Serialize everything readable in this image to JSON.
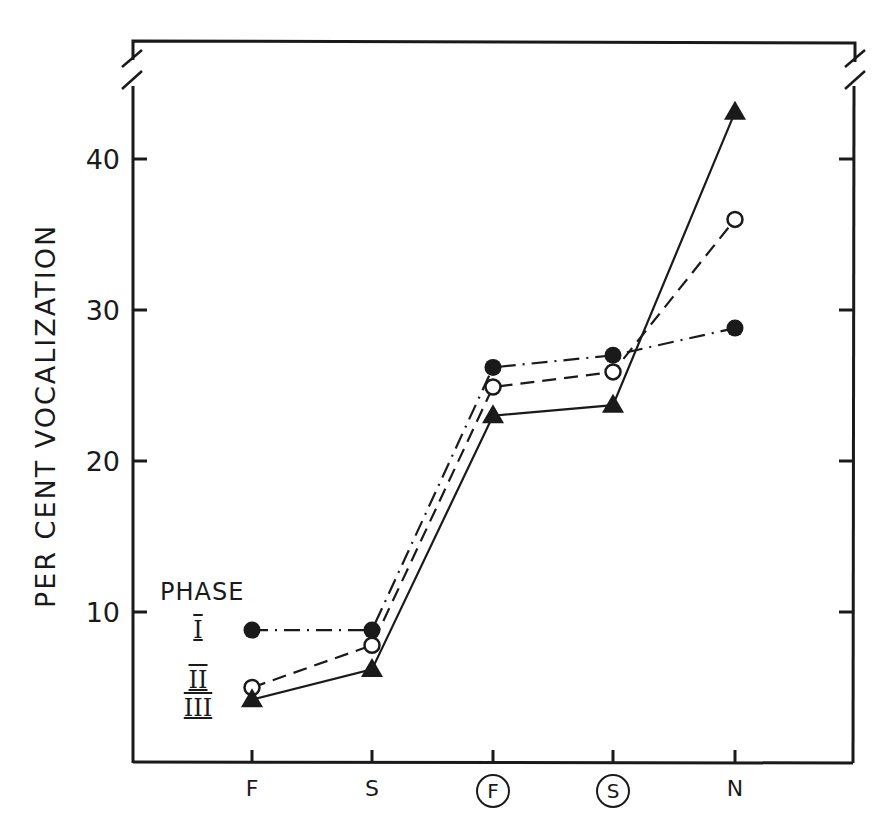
{
  "chart_data": {
    "type": "line",
    "title": "",
    "xlabel": "",
    "ylabel": "PER CENT VOCALIZATION",
    "categories": [
      "F",
      "S",
      "F",
      "S",
      "N"
    ],
    "category_display": [
      "F",
      "S",
      "Ⓕ",
      "Ⓢ",
      "N"
    ],
    "category_circled": [
      false,
      false,
      true,
      true,
      false
    ],
    "yticks": [
      10,
      20,
      30,
      40
    ],
    "ylim": [
      0,
      45
    ],
    "y_axis_break": true,
    "grid": false,
    "legend": {
      "title": "PHASE",
      "position": "lower-left, labels beside first data column",
      "entries": [
        "I",
        "II",
        "III"
      ]
    },
    "series": [
      {
        "name": "I",
        "marker": "filled-circle",
        "line_style": "dash-dot",
        "values": [
          8.8,
          8.8,
          26.2,
          27.0,
          28.8
        ]
      },
      {
        "name": "II",
        "marker": "open-circle",
        "line_style": "dashed",
        "values": [
          5.0,
          7.8,
          24.9,
          25.9,
          36.0
        ]
      },
      {
        "name": "III",
        "marker": "filled-triangle",
        "line_style": "solid",
        "values": [
          4.2,
          6.2,
          23.0,
          23.7,
          43.1
        ]
      }
    ]
  },
  "labels": {
    "ylabel": "PER CENT VOCALIZATION",
    "yticks": [
      "10",
      "20",
      "30",
      "40"
    ],
    "xticks": [
      "F",
      "S",
      "F",
      "S",
      "N"
    ],
    "legend_title": "PHASE",
    "legend_entries": [
      "I",
      "II",
      "III"
    ]
  },
  "colors": {
    "ink": "#1a1a1a",
    "background": "#ffffff"
  }
}
